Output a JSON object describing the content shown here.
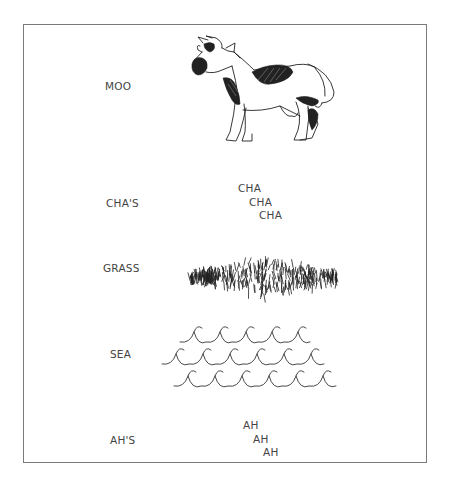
{
  "rows": [
    {
      "label": "MOO",
      "illustration": "cow-drawing"
    },
    {
      "label": "CHA'S",
      "stack": [
        "CHA",
        "CHA",
        "CHA"
      ]
    },
    {
      "label": "GRASS",
      "illustration": "grass-drawing"
    },
    {
      "label": "SEA",
      "illustration": "waves-drawing"
    },
    {
      "label": "AH'S",
      "stack": [
        "AH",
        "AH",
        "AH"
      ]
    }
  ],
  "colors": {
    "ink": "#222222",
    "text": "#444444",
    "frame": "#7a7a7a",
    "background": "#ffffff"
  }
}
